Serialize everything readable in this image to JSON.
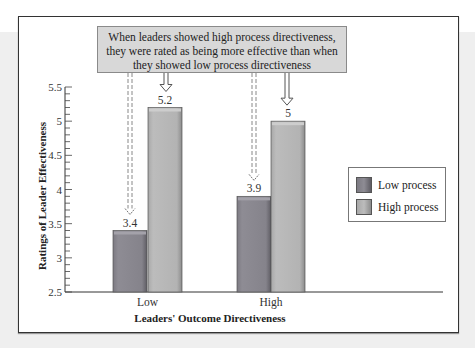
{
  "chart_data": {
    "type": "bar",
    "title": "",
    "annotation": "When leaders showed high process directiveness, they were rated as being more effective than when they showed low process directiveness",
    "annotation_lines": [
      "When leaders showed high process directiveness,",
      "they were rated as being more effective than when",
      "they showed low process directiveness"
    ],
    "categories": [
      "Low",
      "High"
    ],
    "series": [
      {
        "name": "Low process",
        "values": [
          3.4,
          3.9
        ],
        "color": "#8c8a92"
      },
      {
        "name": "High process",
        "values": [
          5.2,
          5.0
        ],
        "color": "#b4b4b4"
      }
    ],
    "data_labels": [
      [
        "3.4",
        "5.2"
      ],
      [
        "3.9",
        "5"
      ]
    ],
    "xlabel": "Leaders' Outcome Directiveness",
    "ylabel": "Ratings of Leader Effectiveness",
    "ylim": [
      2.5,
      5.5
    ],
    "yticks": [
      "2.5",
      "3",
      "3.5",
      "4",
      "4.5",
      "5",
      "5.5"
    ],
    "minor_tick_step": 0.1,
    "grid": false,
    "legend_position": "right"
  }
}
